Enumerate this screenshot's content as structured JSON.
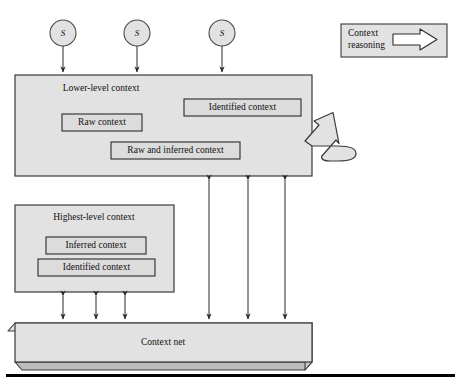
{
  "figure": {
    "background_color": "#ffffff",
    "box_fill": "#e2e2e2",
    "box_stroke": "#3a3a3a",
    "inner_fill": "#dcdcdc",
    "arrow_color": "#2b2b2b",
    "rule_color": "#000000"
  },
  "sources": {
    "label": "S",
    "nodes": [
      {
        "label": "S",
        "cx": 63,
        "cy": 33,
        "r": 13
      },
      {
        "label": "S",
        "cx": 137,
        "cy": 33,
        "r": 13
      },
      {
        "label": "S",
        "cx": 222,
        "cy": 33,
        "r": 13
      }
    ]
  },
  "legend": {
    "name": "context-reasoning-legend",
    "line1": "Context",
    "line2": "reasoning",
    "arrow_glyph": "block-arrow-right"
  },
  "lower_level": {
    "title": "Lower-level context",
    "inner_boxes": [
      {
        "label": "Raw context"
      },
      {
        "label": "Identified context"
      },
      {
        "label": "Raw and inferred context"
      }
    ]
  },
  "highest_level": {
    "title": "Highest-level context",
    "inner_boxes": [
      {
        "label": "Inferred context"
      },
      {
        "label": "Identified context"
      }
    ]
  },
  "context_net": {
    "title": "Context net"
  },
  "connections": {
    "source_arrows_count": 3,
    "lower_to_net_arrows_count": 3,
    "highest_to_net_arrows_count": 3,
    "loop_arrow": "context-reasoning-loop"
  }
}
